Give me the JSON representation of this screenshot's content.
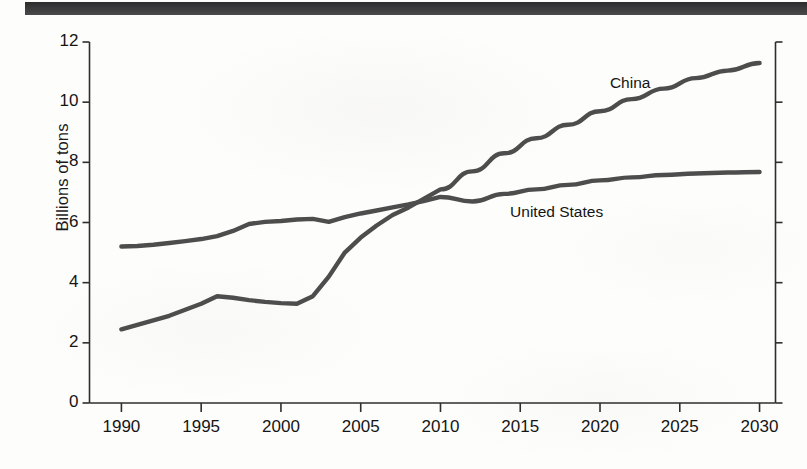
{
  "page": {
    "background_color": "#fdfdfc",
    "top_rule_color": "#32312f",
    "ink_color": "#151515"
  },
  "chart_data": {
    "type": "line",
    "title": "",
    "subtitle": "",
    "xlabel": "",
    "ylabel": "Billions of tons",
    "xlim": [
      1988,
      2031
    ],
    "ylim": [
      0,
      12
    ],
    "yticks": [
      0,
      2,
      4,
      6,
      8,
      10,
      12
    ],
    "xticks": [
      1990,
      1995,
      2000,
      2005,
      2010,
      2015,
      2020,
      2025,
      2030
    ],
    "grid": false,
    "legend_position": "inline-annotation",
    "line_color": "#4d4d4d",
    "line_width": 4.4,
    "annotations": [
      {
        "text": "China",
        "x": 2022,
        "y": 10.6
      },
      {
        "text": "United States",
        "x": 2018,
        "y": 6.3
      }
    ],
    "series": [
      {
        "name": "China",
        "color": "#4d4d4d",
        "x": [
          1990,
          1991,
          1992,
          1993,
          1994,
          1995,
          1996,
          1997,
          1998,
          1999,
          2000,
          2001,
          2002,
          2003,
          2004,
          2005,
          2006,
          2007,
          2008,
          2009,
          2010,
          2012,
          2014,
          2016,
          2018,
          2020,
          2022,
          2024,
          2026,
          2028,
          2030
        ],
        "y": [
          2.45,
          2.6,
          2.75,
          2.9,
          3.1,
          3.3,
          3.55,
          3.5,
          3.42,
          3.36,
          3.32,
          3.3,
          3.55,
          4.2,
          5.0,
          5.5,
          5.9,
          6.25,
          6.5,
          6.8,
          7.1,
          7.7,
          8.3,
          8.8,
          9.25,
          9.7,
          10.1,
          10.45,
          10.8,
          11.05,
          11.3
        ]
      },
      {
        "name": "United States",
        "color": "#4d4d4d",
        "x": [
          1990,
          1991,
          1992,
          1993,
          1994,
          1995,
          1996,
          1997,
          1998,
          1999,
          2000,
          2001,
          2002,
          2003,
          2004,
          2005,
          2006,
          2007,
          2008,
          2009,
          2010,
          2012,
          2014,
          2016,
          2018,
          2020,
          2022,
          2024,
          2026,
          2028,
          2030
        ],
        "y": [
          5.2,
          5.22,
          5.26,
          5.32,
          5.38,
          5.45,
          5.55,
          5.72,
          5.95,
          6.02,
          6.05,
          6.1,
          6.12,
          6.02,
          6.18,
          6.3,
          6.4,
          6.5,
          6.6,
          6.72,
          6.85,
          6.7,
          6.95,
          7.1,
          7.25,
          7.4,
          7.5,
          7.58,
          7.63,
          7.66,
          7.68
        ]
      }
    ]
  },
  "axis": {
    "y_title": "Billions of tons",
    "y_tick_labels": [
      "12",
      "10",
      "8",
      "6",
      "4",
      "2",
      "0"
    ],
    "x_tick_labels": [
      "1990",
      "1995",
      "2000",
      "2005",
      "2010",
      "2015",
      "2020",
      "2025",
      "2030"
    ]
  },
  "labels": {
    "china": "China",
    "united_states": "United States"
  }
}
